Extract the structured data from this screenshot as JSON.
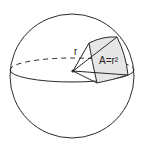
{
  "diagram": {
    "labels": {
      "radius": "r",
      "area": "A=r²"
    },
    "colors": {
      "stroke": "#2a2a2a",
      "patch_fill": "#e6e6e6",
      "background": "#ffffff"
    }
  }
}
